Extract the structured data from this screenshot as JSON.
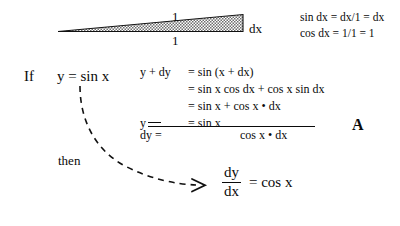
{
  "figure": {
    "triangle": {
      "name": "right-triangle-dx",
      "hypotenuse_label": "1",
      "base_label": "1",
      "opposite_label": "dx",
      "fill": "#8f8f8f",
      "stroke": "#111111"
    },
    "identities": [
      "sin dx = dx/1 = dx",
      "cos dx = 1/1 = 1"
    ]
  },
  "premise": {
    "keyword": "If",
    "equation": "y = sin x"
  },
  "derivation": {
    "rows": [
      {
        "lhs": "y + dy",
        "rhs": "= sin (x + dx)"
      },
      {
        "lhs": "",
        "rhs": "= sin x cos dx + cos x sin dx"
      },
      {
        "lhs": "",
        "rhs": "= sin x   + cos x • dx"
      },
      {
        "lhs": "y",
        "rhs": "= sin x"
      }
    ],
    "result": {
      "lhs": "dy =",
      "rhs": "cos x • dx"
    }
  },
  "conclusion": {
    "keyword": "then",
    "fraction": {
      "numerator": "dy",
      "denominator": "dx"
    },
    "equals": "= cos x"
  },
  "annotation": {
    "panel_label": "A"
  },
  "colors": {
    "ink": "#0a0a0a",
    "hatch": "#8f8f8f",
    "background": "#ffffff"
  }
}
